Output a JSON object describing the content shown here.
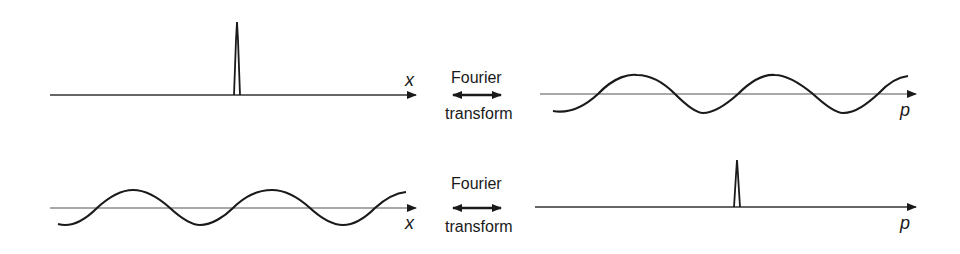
{
  "figure": {
    "rows": [
      {
        "left_panel": {
          "axis_label": "x",
          "curve": "delta-spike",
          "spike_position": "center"
        },
        "transform_label": {
          "line1": "Fourier",
          "line2": "transform",
          "arrow": "double-headed-arrow"
        },
        "right_panel": {
          "axis_label": "p",
          "curve": "sinusoidal-plane-wave"
        }
      },
      {
        "left_panel": {
          "axis_label": "x",
          "curve": "sinusoidal-plane-wave"
        },
        "transform_label": {
          "line1": "Fourier",
          "line2": "transform",
          "arrow": "double-headed-arrow"
        },
        "right_panel": {
          "axis_label": "p",
          "curve": "delta-spike",
          "spike_position": "center"
        }
      }
    ],
    "colors": {
      "ink": "#1a1a1a",
      "axis": "#333333",
      "background": "#ffffff"
    }
  }
}
